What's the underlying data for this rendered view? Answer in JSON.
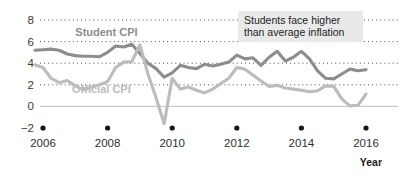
{
  "chart_data": {
    "type": "line",
    "title": "",
    "xlabel": "Year",
    "ylabel": "",
    "xlim": [
      2005.6,
      2016.3
    ],
    "ylim": [
      -2,
      8
    ],
    "grid": true,
    "legend_position": "inline-labels",
    "y_ticks": [
      "8",
      "6",
      "4",
      "2",
      "0",
      "−2"
    ],
    "y_tick_values": [
      8,
      6,
      4,
      2,
      0,
      -2
    ],
    "x_ticks": [
      "2006",
      "2008",
      "2010",
      "2012",
      "2014",
      "2016"
    ],
    "x_tick_values": [
      2006,
      2008,
      2010,
      2012,
      2014,
      2016
    ],
    "annotations": [
      {
        "name": "callout",
        "line1": "Students face higher",
        "line2": "than average inflation"
      }
    ],
    "series": [
      {
        "name": "Student CPI",
        "color": "#8d8d8d",
        "label_x": 2007.0,
        "label_y": 6.55,
        "x": [
          2005.75,
          2006.0,
          2006.25,
          2006.5,
          2006.75,
          2007.0,
          2007.25,
          2007.5,
          2007.75,
          2008.0,
          2008.25,
          2008.5,
          2008.75,
          2009.0,
          2009.25,
          2009.5,
          2009.75,
          2010.0,
          2010.25,
          2010.5,
          2010.75,
          2011.0,
          2011.25,
          2011.5,
          2011.75,
          2012.0,
          2012.25,
          2012.5,
          2012.75,
          2013.0,
          2013.25,
          2013.5,
          2013.75,
          2014.0,
          2014.25,
          2014.5,
          2014.75,
          2015.0,
          2015.25,
          2015.5,
          2015.75,
          2016.0
        ],
        "y": [
          5.2,
          5.25,
          5.3,
          5.2,
          4.85,
          4.7,
          4.65,
          4.65,
          4.6,
          5.0,
          5.6,
          5.5,
          5.75,
          4.9,
          4.0,
          3.5,
          2.7,
          3.1,
          3.8,
          3.6,
          3.5,
          3.9,
          3.75,
          3.9,
          4.1,
          4.75,
          4.4,
          4.5,
          3.8,
          4.55,
          5.1,
          4.2,
          4.55,
          5.1,
          4.4,
          3.3,
          2.6,
          2.55,
          3.0,
          3.45,
          3.3,
          3.4
        ]
      },
      {
        "name": "Official CPI",
        "color": "#bcbcbc",
        "label_x": 2006.9,
        "label_y": 1.25,
        "x": [
          2005.75,
          2006.0,
          2006.25,
          2006.5,
          2006.75,
          2007.0,
          2007.25,
          2007.5,
          2007.75,
          2008.0,
          2008.25,
          2008.5,
          2008.75,
          2009.0,
          2009.25,
          2009.5,
          2009.75,
          2010.0,
          2010.25,
          2010.5,
          2010.75,
          2011.0,
          2011.25,
          2011.5,
          2011.75,
          2012.0,
          2012.25,
          2012.5,
          2012.75,
          2013.0,
          2013.25,
          2013.5,
          2013.75,
          2014.0,
          2014.25,
          2014.5,
          2014.75,
          2015.0,
          2015.25,
          2015.5,
          2015.75,
          2016.0
        ],
        "y": [
          3.85,
          3.6,
          2.6,
          2.2,
          2.4,
          1.9,
          1.55,
          1.8,
          2.0,
          2.3,
          3.6,
          4.1,
          4.15,
          5.7,
          3.0,
          0.8,
          -1.6,
          2.6,
          1.6,
          1.8,
          1.5,
          1.25,
          1.6,
          2.1,
          2.6,
          3.6,
          3.45,
          2.9,
          2.35,
          1.85,
          1.95,
          1.7,
          1.6,
          1.5,
          1.35,
          1.45,
          1.9,
          1.85,
          0.7,
          0.05,
          0.1,
          1.15
        ]
      }
    ]
  }
}
